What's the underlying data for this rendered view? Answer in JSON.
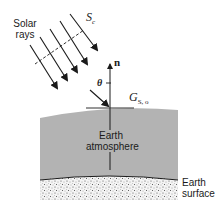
{
  "diagram": {
    "labels": {
      "solar_rays": [
        "Solar",
        "rays"
      ],
      "sc_symbol": "S",
      "sc_subscript": "c",
      "normal": "n",
      "theta": "θ",
      "g_symbol": "G",
      "g_subscript": "S, o",
      "atmosphere": [
        "Earth",
        "atmosphere"
      ],
      "surface": [
        "Earth",
        "surface"
      ]
    },
    "colors": {
      "atmosphere_fill": "#b3b3b3",
      "ink": "#1a1a1a",
      "background": "#ffffff"
    }
  }
}
